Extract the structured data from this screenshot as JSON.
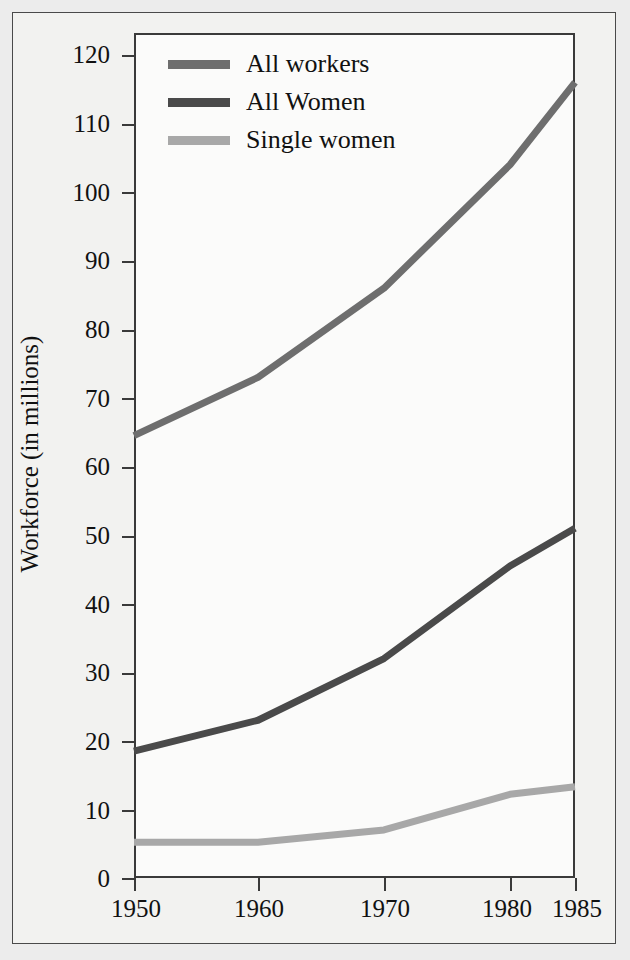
{
  "chart_data": {
    "type": "line",
    "title": "",
    "subtitle": "",
    "xlabel": "",
    "ylabel": "Workforce (in millions)",
    "x": [
      1950,
      1960,
      1970,
      1980,
      1985
    ],
    "xtick_labels": [
      "1950",
      "1960",
      "1970",
      "1980",
      "1985"
    ],
    "ytick_labels": [
      "0",
      "10",
      "20",
      "30",
      "40",
      "50",
      "60",
      "70",
      "80",
      "90",
      "100",
      "110",
      "120"
    ],
    "ytick_values": [
      0,
      10,
      20,
      30,
      40,
      50,
      60,
      70,
      80,
      90,
      100,
      110,
      120
    ],
    "xlim": [
      1950,
      1985
    ],
    "ylim": [
      0,
      120
    ],
    "grid": false,
    "legend_position": "top-left-inside",
    "series": [
      {
        "name": "All workers",
        "color": "#6e6e6e",
        "values": [
          64.5,
          73.0,
          86.0,
          104.0,
          116.0
        ]
      },
      {
        "name": "All Women",
        "color": "#4a4a4a",
        "values": [
          18.5,
          23.0,
          32.0,
          45.5,
          51.0
        ]
      },
      {
        "name": "Single women",
        "color": "#a8a8a8",
        "values": [
          5.2,
          5.2,
          7.0,
          12.2,
          13.3
        ]
      }
    ]
  },
  "figure": {
    "background_color": "#ececec",
    "panel_color": "#fbfbfa",
    "axis_color": "#3a3a3a",
    "text_color": "#111111"
  }
}
